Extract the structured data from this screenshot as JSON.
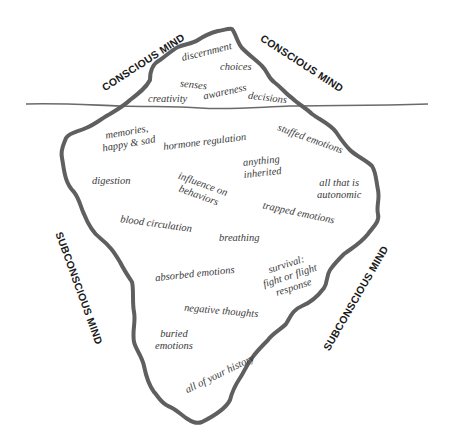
{
  "diagram": {
    "type": "iceberg",
    "colors": {
      "outline": "#5f5f5f",
      "waterline": "#6a6a6a",
      "label_text": "#3a3a3a",
      "section_text": "#1a1a1a",
      "background": "#ffffff"
    },
    "section_labels": {
      "conscious_left": "CONSCIOUS MIND",
      "conscious_right": "CONSCIOUS MIND",
      "subconscious_left": "SUBCONSCIOUS MIND",
      "subconscious_right": "SUBCONSCIOUS MIND"
    },
    "above_water": {
      "discernment": "discernment",
      "choices": "choices",
      "senses": "senses",
      "awareness": "awareness",
      "creativity": "creativity",
      "decisions": "decisions"
    },
    "below_water": {
      "memories_line1": "memories,",
      "memories_line2": "happy & sad",
      "hormone_regulation": "hormone regulation",
      "stuffed_emotions": "stuffed emotions",
      "anything_inherited_line1": "anything",
      "anything_inherited_line2": "inherited",
      "digestion": "digestion",
      "influence_line1": "influence on",
      "influence_line2": "behaviors",
      "all_autonomic_line1": "all that is",
      "all_autonomic_line2": "autonomic",
      "trapped_emotions": "trapped emotions",
      "blood_circulation": "blood circulation",
      "breathing": "breathing",
      "absorbed_emotions": "absorbed emotions",
      "survival_line1": "survival:",
      "survival_line2": "fight or flight",
      "survival_line3": "response",
      "negative_thoughts": "negative thoughts",
      "buried_line1": "buried",
      "buried_line2": "emotions",
      "all_history": "all of your history"
    }
  }
}
